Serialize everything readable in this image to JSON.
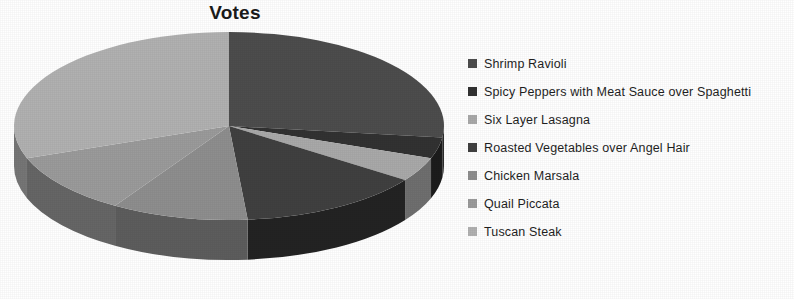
{
  "chart_data": {
    "type": "pie",
    "title": "Votes",
    "xlabel": "",
    "ylabel": "",
    "legend_position": "right",
    "grid": false,
    "three_d": true,
    "start_angle_deg": 0,
    "direction": "clockwise",
    "categories": [
      "Shrimp Ravioli",
      "Spicy Peppers with Meat Sauce over Spaghetti",
      "Six Layer Lasagna",
      "Roasted Vegetables over Angel Hair",
      "Chicken Marsala",
      "Quail Piccata",
      "Tuscan Steak"
    ],
    "values": [
      27,
      4,
      4,
      14,
      10,
      10,
      31
    ],
    "slice_angles_deg": [
      97,
      13,
      15,
      50,
      37,
      38,
      110
    ],
    "colors": [
      "#4d4d4d",
      "#323232",
      "#a9a9a9",
      "#404040",
      "#8e8e8e",
      "#9b9b9b",
      "#b1b1b1"
    ],
    "side_colors": [
      "#2b2b2b",
      "#1c1c1c",
      "#6f6f6f",
      "#232323",
      "#5d5d5d",
      "#666666",
      "#767676"
    ]
  },
  "legend": {
    "items": [
      {
        "label": "Shrimp Ravioli",
        "color": "#4d4d4d"
      },
      {
        "label": "Spicy Peppers with Meat Sauce over Spaghetti",
        "color": "#323232"
      },
      {
        "label": "Six Layer Lasagna",
        "color": "#a9a9a9"
      },
      {
        "label": "Roasted Vegetables over Angel Hair",
        "color": "#404040"
      },
      {
        "label": "Chicken Marsala",
        "color": "#8e8e8e"
      },
      {
        "label": "Quail Piccata",
        "color": "#9b9b9b"
      },
      {
        "label": "Tuscan Steak",
        "color": "#b1b1b1"
      }
    ]
  },
  "artifacts": {
    "bleed_text": ""
  }
}
